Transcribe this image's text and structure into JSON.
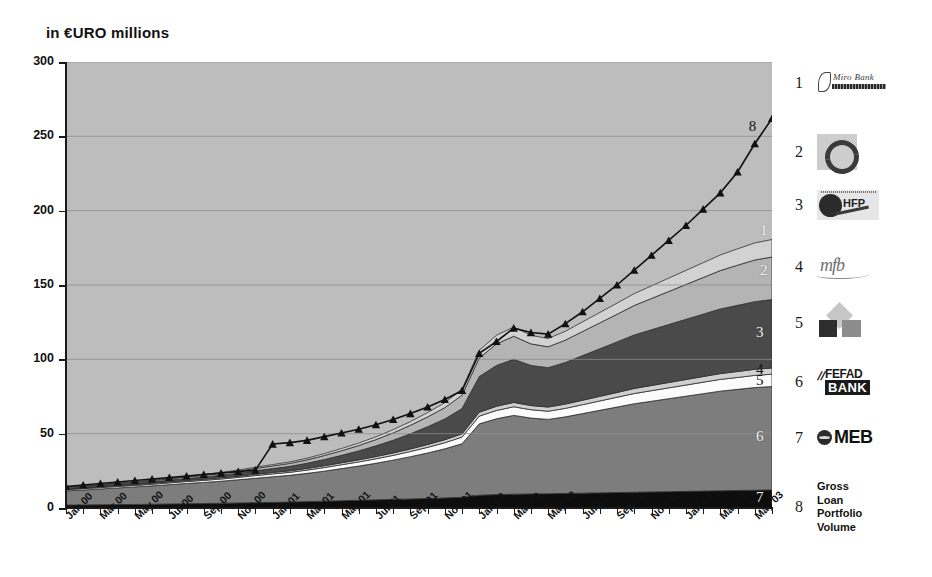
{
  "chart_title": "in €URO millions",
  "chart_data": {
    "type": "area",
    "title": "in €URO millions",
    "xlabel": "",
    "ylabel": "in €URO millions",
    "ylim": [
      0,
      300
    ],
    "yticks": [
      0,
      50,
      100,
      150,
      200,
      250,
      300
    ],
    "grid": true,
    "legend_position": "right",
    "categories": [
      "Jan 00",
      "Feb 00",
      "Mar 00",
      "Apr 00",
      "May 00",
      "Jun 00",
      "Jul 00",
      "Aug 00",
      "Sep 00",
      "Oct 00",
      "Nov 00",
      "Dec 00",
      "Jan 01",
      "Feb 01",
      "Mar 01",
      "Apr 01",
      "May 01",
      "Jun 01",
      "Jul 01",
      "Aug 01",
      "Sep 01",
      "Oct 01",
      "Nov 01",
      "Dec 01",
      "Jan 02",
      "Feb 02",
      "Mar 02",
      "Apr 02",
      "May 02",
      "Jun 02",
      "Jul 02",
      "Aug 02",
      "Sep 02",
      "Oct 02",
      "Nov 02",
      "Dec 02",
      "Jan 03",
      "Feb 03",
      "Mar 03",
      "Apr 03",
      "May 03",
      "Jun 03"
    ],
    "xtick_labels": [
      "Jan 00",
      "Mar 00",
      "May 00",
      "Jul 00",
      "Sep 00",
      "Nov 00",
      "Jan 01",
      "Mar 01",
      "May 01",
      "Jul 01",
      "Sep 01",
      "Nov 01",
      "Jan 02",
      "Mar 02",
      "May 02",
      "Jul 02",
      "Sep 02",
      "Nov 02",
      "Jan 03",
      "Mar 03",
      "May 03"
    ],
    "stacking_order_bottom_to_top": [
      "7",
      "6",
      "5",
      "4",
      "3",
      "2",
      "1"
    ],
    "series": [
      {
        "name": "7",
        "legend": "MEB",
        "color": "#0d0d0d",
        "values": [
          2.0,
          2.1,
          2.2,
          2.3,
          2.4,
          2.5,
          2.7,
          2.9,
          3.0,
          3.2,
          3.4,
          3.6,
          3.8,
          4.0,
          4.3,
          4.6,
          4.9,
          5.2,
          5.5,
          5.8,
          6.1,
          6.4,
          6.8,
          7.2,
          8.6,
          9.0,
          9.3,
          9.5,
          9.6,
          9.8,
          10.0,
          10.2,
          10.4,
          10.6,
          10.8,
          11.0,
          11.2,
          11.4,
          11.6,
          11.8,
          12.0,
          12.2
        ]
      },
      {
        "name": "6",
        "legend": "FEFAD BANK",
        "color": "#7d7d7d",
        "values": [
          9.5,
          10.0,
          10.6,
          11.2,
          11.8,
          12.4,
          13.0,
          13.6,
          14.2,
          14.8,
          15.6,
          16.4,
          17.2,
          18.0,
          19.0,
          20.2,
          21.6,
          23.0,
          24.6,
          26.4,
          28.4,
          30.6,
          33.0,
          36.0,
          48.0,
          51.0,
          53.0,
          51.0,
          50.0,
          51.5,
          53.5,
          55.5,
          57.5,
          59.5,
          61.0,
          62.5,
          64.0,
          65.5,
          67.0,
          68.0,
          69.0,
          69.5
        ]
      },
      {
        "name": "5",
        "legend": "ProCredit (diamond)",
        "color": "#fbfbfb",
        "values": [
          0.8,
          0.9,
          0.9,
          1.0,
          1.0,
          1.1,
          1.2,
          1.3,
          1.4,
          1.5,
          1.6,
          1.8,
          1.9,
          2.0,
          2.2,
          2.4,
          2.6,
          2.8,
          3.0,
          3.2,
          3.5,
          3.8,
          4.1,
          4.5,
          5.2,
          5.6,
          5.8,
          5.6,
          5.5,
          5.7,
          6.0,
          6.3,
          6.6,
          6.9,
          7.1,
          7.3,
          7.5,
          7.7,
          7.9,
          8.0,
          8.2,
          8.3
        ]
      },
      {
        "name": "4",
        "legend": "mfb",
        "color": "#cfcfcf",
        "values": [
          0.4,
          0.4,
          0.5,
          0.5,
          0.5,
          0.6,
          0.6,
          0.7,
          0.7,
          0.8,
          0.8,
          0.9,
          1.0,
          1.0,
          1.1,
          1.2,
          1.3,
          1.4,
          1.5,
          1.6,
          1.7,
          1.9,
          2.0,
          2.2,
          2.6,
          2.8,
          2.9,
          2.8,
          2.8,
          2.9,
          3.0,
          3.1,
          3.2,
          3.4,
          3.5,
          3.6,
          3.7,
          3.8,
          3.9,
          4.0,
          4.1,
          4.2
        ]
      },
      {
        "name": "3",
        "legend": "HFP",
        "color": "#4a4a4a",
        "values": [
          0.5,
          0.6,
          0.7,
          0.8,
          0.9,
          1.0,
          1.2,
          1.4,
          1.6,
          1.8,
          2.0,
          2.3,
          2.6,
          3.0,
          3.5,
          4.2,
          5.0,
          6.0,
          7.2,
          8.6,
          10.2,
          12.0,
          14.0,
          17.0,
          24.0,
          27.5,
          29.0,
          27.0,
          26.5,
          28.0,
          30.0,
          32.0,
          34.0,
          36.0,
          37.5,
          39.0,
          40.5,
          42.0,
          43.5,
          44.5,
          45.5,
          46.0
        ]
      },
      {
        "name": "2",
        "legend": "Swirl bank",
        "color": "#b4b4b4",
        "values": [
          0.5,
          0.5,
          0.6,
          0.6,
          0.7,
          0.8,
          0.9,
          1.0,
          1.1,
          1.2,
          1.4,
          1.6,
          1.8,
          2.0,
          2.3,
          2.7,
          3.1,
          3.6,
          4.2,
          4.9,
          5.7,
          6.6,
          7.6,
          9.0,
          12.5,
          14.5,
          15.5,
          14.5,
          14.0,
          15.0,
          16.2,
          17.4,
          18.6,
          19.8,
          21.0,
          22.2,
          23.4,
          24.6,
          25.8,
          27.0,
          28.0,
          28.6
        ]
      },
      {
        "name": "1",
        "legend": "Miro Bank",
        "color": "#d2d2d2",
        "values": [
          0.3,
          0.3,
          0.3,
          0.4,
          0.4,
          0.4,
          0.5,
          0.5,
          0.6,
          0.6,
          0.7,
          0.8,
          0.9,
          1.0,
          1.1,
          1.3,
          1.5,
          1.7,
          1.9,
          2.2,
          2.5,
          2.9,
          3.3,
          3.9,
          5.1,
          5.8,
          6.2,
          5.8,
          5.6,
          6.0,
          6.5,
          7.0,
          7.5,
          8.0,
          8.5,
          9.0,
          9.5,
          10.0,
          10.5,
          11.0,
          11.5,
          11.8
        ]
      }
    ],
    "line_series": {
      "name": "8",
      "legend": "Gross Loan Portfolio Volume",
      "marker": "triangle",
      "color": "#111111",
      "values": [
        14.5,
        15.5,
        16.5,
        17.5,
        18.5,
        19.5,
        20.5,
        21.5,
        22.5,
        23.5,
        24.5,
        25.5,
        43.0,
        44.0,
        45.5,
        48.0,
        50.5,
        53.0,
        56.0,
        59.5,
        63.5,
        68.0,
        73.0,
        79.0,
        104.0,
        112.0,
        121.0,
        118.0,
        117.0,
        124.0,
        132.0,
        141.0,
        150.0,
        160.0,
        170.0,
        180.0,
        190.0,
        201.0,
        212.0,
        226.0,
        245.0,
        262.0
      ]
    },
    "band_labels": [
      "1",
      "2",
      "3",
      "4",
      "5",
      "6",
      "7"
    ],
    "line_label": "8"
  },
  "legend": {
    "items": [
      {
        "num": "1",
        "name": "Miro Bank",
        "logo": "miro-bank-logo",
        "text": "Miro Bank"
      },
      {
        "num": "2",
        "name": "Swirl Bank",
        "logo": "swirl-logo",
        "text": ""
      },
      {
        "num": "3",
        "name": "HFP",
        "logo": "hfp-logo",
        "text": "HFP"
      },
      {
        "num": "4",
        "name": "mfb",
        "logo": "mfb-logo",
        "text": "mfb"
      },
      {
        "num": "5",
        "name": "Diamond Bank",
        "logo": "diamond-squares-logo",
        "text": ""
      },
      {
        "num": "6",
        "name": "FEFAD BANK",
        "logo": "fefad-bank-logo",
        "text_top": "FEFAD",
        "text_bottom": "BANK"
      },
      {
        "num": "7",
        "name": "MEB",
        "logo": "meb-logo",
        "text": "MEB"
      },
      {
        "num": "8",
        "name": "Gross Loan Portfolio Volume",
        "logo": "",
        "text": "Gross Loan Portfolio Volume"
      }
    ]
  },
  "colors": {
    "plot_background": "#bdbdbd",
    "band_1": "#d2d2d2",
    "band_2": "#b4b4b4",
    "band_3": "#4a4a4a",
    "band_4": "#cfcfcf",
    "band_5": "#fbfbfb",
    "band_6": "#7d7d7d",
    "band_7": "#0d0d0d",
    "line_8": "#111111",
    "axis": "#1a1a1a",
    "gridline": "#8c8c8c"
  }
}
